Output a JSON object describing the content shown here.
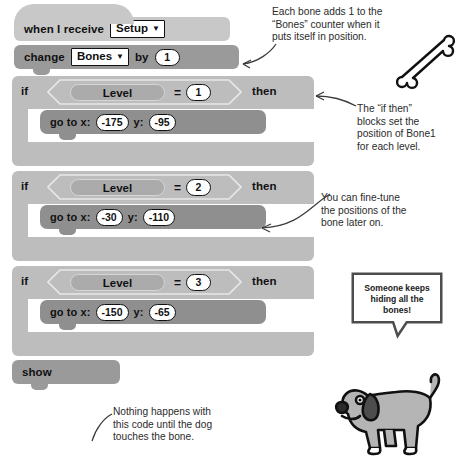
{
  "script": {
    "hat_block": {
      "label_before": "when I receive",
      "dropdown_value": "Setup",
      "caret": "▼"
    },
    "change_block": {
      "label_before": "change",
      "dropdown_value": "Bones",
      "label_mid": "by",
      "value": "1",
      "caret": "▼"
    },
    "if_blocks": [
      {
        "if_label": "if",
        "then_label": "then",
        "variable": "Level",
        "operator": "=",
        "compare_value": "1",
        "inner": {
          "label_x": "go to x:",
          "x": "-175",
          "label_y": "y:",
          "y": "-95"
        }
      },
      {
        "if_label": "if",
        "then_label": "then",
        "variable": "Level",
        "operator": "=",
        "compare_value": "2",
        "inner": {
          "label_x": "go to x:",
          "x": "-30",
          "label_y": "y:",
          "y": "-110"
        }
      },
      {
        "if_label": "if",
        "then_label": "then",
        "variable": "Level",
        "operator": "=",
        "compare_value": "3",
        "inner": {
          "label_x": "go to x:",
          "x": "-150",
          "label_y": "y:",
          "y": "-65"
        }
      }
    ],
    "show_block": {
      "label": "show"
    }
  },
  "annotations": {
    "top_right": "Each bone adds 1 to the\n“Bones” counter when it\nputs itself in position.",
    "if_then": "The “if then”\nblocks set the\nposition of Bone1\nfor each level.",
    "fine_tune": "You can fine-tune\nthe positions of the\nbone later on.",
    "bottom": "Nothing happens with\nthis code until the dog\ntouches the bone."
  },
  "speech_bubble": {
    "line1": "Someone keeps",
    "line2": "hiding all the",
    "line3": "bones!"
  },
  "sprites": {
    "bone": "bone-sprite",
    "dog": "dog-sprite"
  },
  "colors": {
    "hat_block": "#c8c8c8",
    "stack_block": "#9a9a9a",
    "inner_block": "#8f8f8f",
    "control_block": "#bdbdbd",
    "oval_fill": "#ababab",
    "text": "#111111",
    "annotation_text": "#2b2b2b",
    "page_bg": "#ffffff"
  }
}
